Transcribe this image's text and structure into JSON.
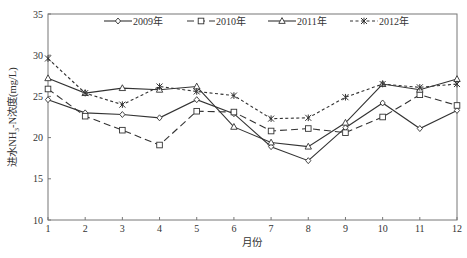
{
  "chart_data": {
    "type": "line",
    "title": "",
    "xlabel": "月份",
    "ylabel": "进水NH₃-N浓度(mg/L)",
    "ylabel_parts": {
      "pre": "进水NH",
      "sub": "3",
      "post": "-N浓度(mg/L)"
    },
    "xlim": [
      1,
      12
    ],
    "ylim": [
      10,
      35
    ],
    "x": [
      1,
      2,
      3,
      4,
      5,
      6,
      7,
      8,
      9,
      10,
      11,
      12
    ],
    "x_ticks": [
      "1",
      "2",
      "3",
      "4",
      "5",
      "6",
      "7",
      "8",
      "9",
      "10",
      "11",
      "12"
    ],
    "y_ticks": [
      10,
      15,
      20,
      25,
      30,
      35
    ],
    "grid": false,
    "legend_position": "top-inside",
    "series": [
      {
        "name": "2009年",
        "marker": "diamond",
        "line_style": "solid",
        "color": "#333333",
        "values": [
          24.6,
          23.0,
          22.8,
          22.4,
          24.6,
          22.9,
          18.9,
          17.2,
          21.2,
          24.2,
          21.1,
          23.3
        ]
      },
      {
        "name": "2010年",
        "marker": "square",
        "line_style": "dashed",
        "color": "#333333",
        "values": [
          25.9,
          22.6,
          20.9,
          19.1,
          23.2,
          23.1,
          20.8,
          21.1,
          20.6,
          22.5,
          25.2,
          23.9
        ]
      },
      {
        "name": "2011年",
        "marker": "triangle",
        "line_style": "solid",
        "color": "#333333",
        "values": [
          27.2,
          25.4,
          26.0,
          25.8,
          26.2,
          21.3,
          19.4,
          18.9,
          21.8,
          26.5,
          25.8,
          27.1
        ]
      },
      {
        "name": "2012年",
        "marker": "asterisk",
        "line_style": "dotted",
        "color": "#333333",
        "values": [
          29.6,
          25.4,
          24.0,
          26.2,
          25.6,
          25.1,
          22.3,
          22.4,
          24.9,
          26.5,
          26.1,
          26.5
        ]
      }
    ]
  }
}
